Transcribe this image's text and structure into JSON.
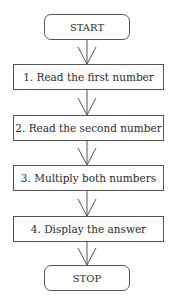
{
  "diagram": {
    "type": "flowchart",
    "nodes": [
      {
        "id": "start",
        "shape": "terminal",
        "label": "START"
      },
      {
        "id": "step1",
        "shape": "process",
        "label": "1. Read the first number"
      },
      {
        "id": "step2",
        "shape": "process",
        "label": "2. Read the second number"
      },
      {
        "id": "step3",
        "shape": "process",
        "label": "3. Multiply both numbers"
      },
      {
        "id": "step4",
        "shape": "process",
        "label": "4. Display the answer"
      },
      {
        "id": "stop",
        "shape": "terminal",
        "label": "STOP"
      }
    ],
    "edges": [
      {
        "from": "start",
        "to": "step1"
      },
      {
        "from": "step1",
        "to": "step2"
      },
      {
        "from": "step2",
        "to": "step3"
      },
      {
        "from": "step3",
        "to": "step4"
      },
      {
        "from": "step4",
        "to": "stop"
      }
    ]
  }
}
